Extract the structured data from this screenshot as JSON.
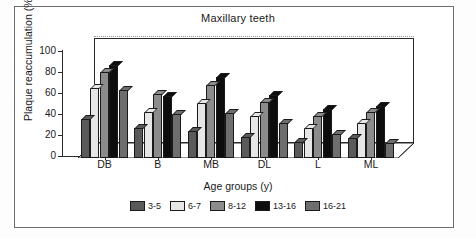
{
  "chart_data": {
    "type": "bar",
    "title": "Maxillary teeth",
    "xlabel": "Age groups (y)",
    "ylabel": "Plaque reaccumulation (%)",
    "categories": [
      "DB",
      "B",
      "MB",
      "DL",
      "L",
      "ML"
    ],
    "ylim": [
      0,
      100
    ],
    "yticks": [
      0,
      20,
      40,
      60,
      80,
      100
    ],
    "grid": true,
    "legend_position": "bottom",
    "style": "3d-grouped-bar",
    "series": [
      {
        "name": "3-5",
        "color": "#5a5a5a",
        "values": [
          37,
          29,
          26,
          20,
          15,
          19
        ]
      },
      {
        "name": "6-7",
        "color": "#e6e6e6",
        "values": [
          67,
          44,
          52,
          40,
          29,
          33
        ]
      },
      {
        "name": "8-12",
        "color": "#8c8c8c",
        "values": [
          82,
          61,
          70,
          53,
          40,
          44
        ]
      },
      {
        "name": "13-16",
        "color": "#0d0d0d",
        "values": [
          89,
          59,
          77,
          60,
          47,
          50
        ]
      },
      {
        "name": "16-21",
        "color": "#6e6e6e",
        "values": [
          65,
          42,
          43,
          33,
          23,
          14
        ]
      }
    ]
  }
}
